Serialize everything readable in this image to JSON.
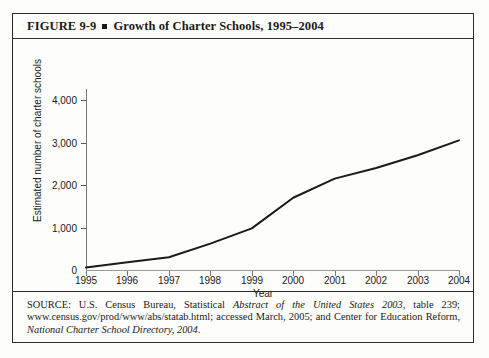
{
  "figure": {
    "number": "FIGURE 9-9",
    "bullet": "square-bullet",
    "title": "Growth of Charter Schools, 1995–2004",
    "full_title": "FIGURE 9-9 ▪ Growth of Charter Schools, 1995–2004"
  },
  "source": {
    "prefix": "SOURCE: U.S. Census Bureau, Statistical ",
    "italic1": "Abstract of the United States 2003",
    "middle": ", table 239; www.census.gov/prod/www/abs/statab.html; accessed March, 2005; and Center for Education Reform, ",
    "italic2": "National Charter School Directory, 2004",
    "suffix": "."
  },
  "chart_data": {
    "type": "line",
    "title": "Growth of Charter Schools, 1995–2004",
    "xlabel": "Year",
    "ylabel": "Estimated number of charter schools",
    "x": [
      1995,
      1996,
      1997,
      1998,
      1999,
      2000,
      2001,
      2002,
      2003,
      2004
    ],
    "xticklabels": [
      "1995",
      "1996",
      "1997",
      "1998",
      "1999",
      "2000",
      "2001",
      "2002",
      "2003",
      "2004"
    ],
    "values": [
      60,
      180,
      300,
      620,
      980,
      1700,
      2150,
      2400,
      2700,
      3050
    ],
    "series": [
      {
        "name": "Estimated number of charter schools",
        "values": [
          60,
          180,
          300,
          620,
          980,
          1700,
          2150,
          2400,
          2700,
          3050
        ]
      }
    ],
    "yticks": [
      0,
      1000,
      2000,
      3000,
      4000
    ],
    "yticklabels": [
      "0",
      "1,000",
      "2,000",
      "3,000",
      "4,000"
    ],
    "ylim": [
      0,
      4000
    ],
    "xlim": [
      1995,
      2004
    ],
    "grid": false,
    "legend": false,
    "line_color": "#1a1a1a",
    "line_width": 2
  }
}
